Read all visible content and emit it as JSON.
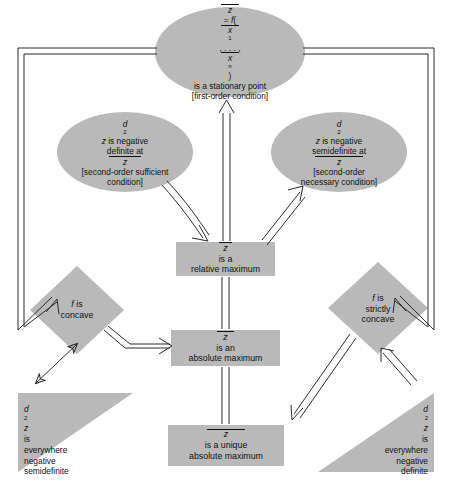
{
  "figure": {
    "type": "flow-diagram",
    "colors": {
      "shape_fill": "#b9b9b9",
      "shape_fill_light": "#bdbdbd",
      "line": "#2b2b2b",
      "background": "#ffffff",
      "text": "#111111"
    }
  },
  "nodes": {
    "stationary_point": {
      "shape": "ellipse",
      "lines": [
        "z = f(x1, . . . , xn)",
        "is a stationary point",
        "[first-order condition]"
      ]
    },
    "negative_definite": {
      "shape": "ellipse",
      "lines": [
        "d2z is negative",
        "definite at z",
        "[second-order sufficient",
        "condition]"
      ]
    },
    "negative_semidefinite": {
      "shape": "ellipse",
      "lines": [
        "d2z is negative",
        "semidefinite at z",
        "[second-order",
        "necessary condition]"
      ]
    },
    "relative_maximum": {
      "shape": "rectangle",
      "lines": [
        "z is a",
        "relative maximum"
      ]
    },
    "absolute_maximum": {
      "shape": "rectangle",
      "lines": [
        "z is an",
        "absolute maximum"
      ]
    },
    "unique_absolute_maximum": {
      "shape": "rectangle",
      "lines": [
        "z is a unique",
        "absolute maximum"
      ]
    },
    "f_concave": {
      "shape": "diamond",
      "lines": [
        "f is",
        "concave"
      ]
    },
    "f_strictly_concave": {
      "shape": "diamond",
      "lines": [
        "f is",
        "strictly",
        "concave"
      ]
    },
    "everywhere_negative_semidefinite": {
      "shape": "triangle",
      "lines": [
        "d2z",
        "is",
        "everywhere",
        "negative",
        "semidefinite"
      ]
    },
    "everywhere_negative_definite": {
      "shape": "triangle",
      "lines": [
        "d2z",
        "is",
        "everywhere",
        "negative",
        "definite"
      ]
    }
  },
  "edges": [
    {
      "from": "relative_maximum",
      "to": "stationary_point",
      "style": "double-line-arrow",
      "direction": "up"
    },
    {
      "from": "negative_definite",
      "to": "relative_maximum",
      "style": "double-line-curved-arrow",
      "direction": "down-right"
    },
    {
      "from": "relative_maximum",
      "to": "negative_semidefinite",
      "style": "double-line-arrow",
      "direction": "up-right"
    },
    {
      "from": "stationary_point",
      "to": "f_concave",
      "style": "double-line-routed",
      "direction": "left-down"
    },
    {
      "from": "stationary_point",
      "to": "f_strictly_concave",
      "style": "double-line-routed",
      "direction": "right-down"
    },
    {
      "from": "f_concave",
      "to": "everywhere_negative_semidefinite",
      "style": "double-headed-arrow",
      "direction": "diagonal"
    },
    {
      "from": "everywhere_negative_definite",
      "to": "f_strictly_concave",
      "style": "double-line-arrow",
      "direction": "up-left"
    },
    {
      "from": "f_concave",
      "to": "absolute_maximum",
      "style": "double-line-arrow",
      "direction": "right"
    },
    {
      "from": "f_strictly_concave",
      "to": "unique_absolute_maximum",
      "style": "double-line-arrow",
      "direction": "down-left"
    },
    {
      "from": "absolute_maximum",
      "to": "relative_maximum",
      "style": "double-line",
      "direction": "up"
    },
    {
      "from": "unique_absolute_maximum",
      "to": "absolute_maximum",
      "style": "double-line",
      "direction": "up"
    }
  ]
}
